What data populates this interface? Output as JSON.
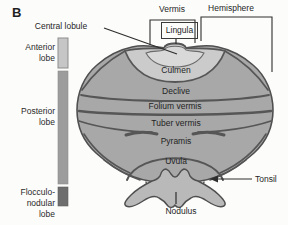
{
  "panel_label": "B",
  "colors": {
    "cerebellum_body": "#a8a8a8",
    "anterior_vermis_highlight": "#cbcbcb",
    "central_lobule_highlight": "#d9d9d9",
    "nodulus_fill": "#b9b9b9",
    "outline": "#4f4f4f",
    "anterior_lobe_bar": "#c6c6c6",
    "posterior_lobe_bar": "#9c9c9c",
    "flocculonodular_lobe_bar": "#6e6e6e"
  },
  "legend": {
    "anterior": "Anterior lobe",
    "posterior": "Posterior lobe",
    "flocculonodular": "Flocculo-nodular lobe"
  },
  "top_labels": {
    "vermis": "Vermis",
    "hemisphere": "Hemisphere",
    "central_lobule": "Central lobule",
    "lingula": "Lingula"
  },
  "vermis_labels": {
    "culmen": "Culmen",
    "declive": "Declive",
    "folium_vermis": "Folium vermis",
    "tuber_vermis": "Tuber vermis",
    "pyramis": "Pyramis",
    "uvula": "Uvula",
    "nodulus": "Nodulus"
  },
  "side_labels": {
    "tonsil": "Tonsil"
  }
}
